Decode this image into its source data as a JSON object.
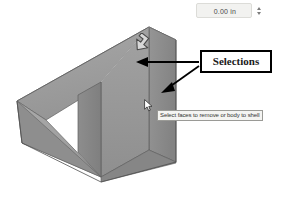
{
  "app": {
    "context": "cad-shell-feature-viewport",
    "background_color": "#ffffff"
  },
  "thickness": {
    "label_name": "thickness-input",
    "value": "0.00 in",
    "placeholder": "0.00 in",
    "spinner_up": "increment",
    "spinner_down": "decrement",
    "field_bg": "#f2f2f0",
    "field_border": "#dcdcd8"
  },
  "callout": {
    "label": "Selections",
    "border_color": "#000000",
    "background": "#ffffff",
    "text_color": "#1a1a1a"
  },
  "tooltip": {
    "text": "Select faces to remove or body to shell",
    "background": "#f4f4f2",
    "border_color": "#9a9a96",
    "text_color": "#333333"
  },
  "model": {
    "name": "wedge-ramp-solid",
    "colors": {
      "top_ramp_face": "#9d9d9d",
      "front_face": "#9a9a9a",
      "right_face": "#8d8d8d",
      "inner_left_face": "#8a8a8a",
      "inner_base_face": "#a3a3a3",
      "base_left_face": "#929292",
      "edge_line": "#5c5c5c",
      "edge_highlight": "#c8c8c8"
    }
  },
  "annotations": {
    "arrow_top_label": "arrow-to-top-face",
    "arrow_side_label": "arrow-to-side-face",
    "arrow_color": "#000000"
  },
  "cursors": {
    "mouse_pointer": "mouse-pointer-cursor",
    "rotate_glyph": "rotate-arrow-cursor"
  }
}
